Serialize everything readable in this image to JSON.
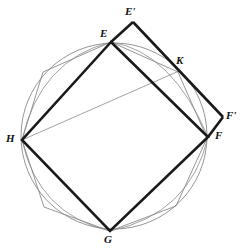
{
  "figure": {
    "canvas": {
      "width": 242,
      "height": 252,
      "background": "#ffffff"
    },
    "colors": {
      "thin_stroke": "#8a8a8a",
      "bold_stroke": "#1a1a1a",
      "label_text": "#111111",
      "background": "#ffffff"
    },
    "stroke_widths": {
      "thin": 0.8,
      "bold": 2.6
    }
  },
  "circle": {
    "name": "circumscribed-circle",
    "cx": 114,
    "cy": 136,
    "r": 93,
    "stroke": "#8a8a8a",
    "stroke_width": 0.9,
    "fill": "none"
  },
  "points": {
    "E": {
      "label": "E",
      "x": 111,
      "y": 42,
      "label_x": 100,
      "label_y": 28
    },
    "F": {
      "label": "F",
      "x": 208,
      "y": 137,
      "label_x": 215,
      "label_y": 130
    },
    "G": {
      "label": "G",
      "x": 110,
      "y": 231,
      "label_x": 104,
      "label_y": 234
    },
    "H": {
      "label": "H",
      "x": 22,
      "y": 140,
      "label_x": 6,
      "label_y": 133
    },
    "Ep": {
      "label": "E'",
      "x": 133,
      "y": 22,
      "label_x": 125,
      "label_y": 6
    },
    "Fp": {
      "label": "F'",
      "x": 223,
      "y": 117,
      "label_x": 226,
      "label_y": 110
    },
    "K": {
      "label": "K",
      "x": 179,
      "y": 71,
      "label_x": 176,
      "label_y": 55
    }
  },
  "octagon": {
    "name": "inscribed-octagon",
    "stroke": "#8a8a8a",
    "stroke_width": 0.9,
    "fill": "none",
    "vertices": [
      {
        "x": 111,
        "y": 42
      },
      {
        "x": 178,
        "y": 72
      },
      {
        "x": 207,
        "y": 138
      },
      {
        "x": 176,
        "y": 206
      },
      {
        "x": 110,
        "y": 231
      },
      {
        "x": 44,
        "y": 207
      },
      {
        "x": 22,
        "y": 140
      },
      {
        "x": 43,
        "y": 72
      }
    ]
  },
  "square": {
    "name": "bold-square-EFGH",
    "stroke": "#1a1a1a",
    "stroke_width": 2.6,
    "fill": "none",
    "vertices": [
      {
        "x": 111,
        "y": 42
      },
      {
        "x": 208,
        "y": 137
      },
      {
        "x": 110,
        "y": 231
      },
      {
        "x": 22,
        "y": 140
      }
    ]
  },
  "bold_paths": [
    {
      "name": "segment-E-to-Eprime",
      "d": "M 111 42 L 133 22"
    },
    {
      "name": "segment-Eprime-to-K-to-Fprime",
      "d": "M 133 22 L 223 117"
    },
    {
      "name": "segment-Fprime-to-F",
      "d": "M 223 117 L 208 137"
    },
    {
      "name": "segment-E-to-K-diagonal",
      "d": "M 111 42 L 208 137"
    }
  ],
  "thin_chords": [
    {
      "name": "chord-E-to-F",
      "x1": 111,
      "y1": 42,
      "x2": 208,
      "y2": 138
    },
    {
      "name": "chord-H-to-E",
      "x1": 22,
      "y1": 140,
      "x2": 111,
      "y2": 42
    },
    {
      "name": "chord-H-to-K",
      "x1": 22,
      "y1": 140,
      "x2": 179,
      "y2": 71
    },
    {
      "name": "chord-H-to-G",
      "x1": 22,
      "y1": 140,
      "x2": 110,
      "y2": 231
    },
    {
      "name": "chord-E-to-Fprime-through-K",
      "x1": 111,
      "y1": 42,
      "x2": 208,
      "y2": 137
    }
  ],
  "thin_arcs": [
    {
      "name": "arc-upper-E-to-F",
      "d": "M 111 42 Q 172 52 208 137"
    },
    {
      "name": "arc-upper-H-to-E",
      "d": "M 22 140 Q 40 60 111 42"
    },
    {
      "name": "arc-lower-H-to-G",
      "d": "M 22 140 Q 38 214 110 231"
    },
    {
      "name": "arc-lower-G-to-F",
      "d": "M 110 231 Q 190 214 208 137"
    }
  ],
  "labels": [
    {
      "key": "Ep",
      "name": "point-label-E-prime"
    },
    {
      "key": "E",
      "name": "point-label-E"
    },
    {
      "key": "K",
      "name": "point-label-K"
    },
    {
      "key": "Fp",
      "name": "point-label-F-prime"
    },
    {
      "key": "F",
      "name": "point-label-F"
    },
    {
      "key": "H",
      "name": "point-label-H"
    },
    {
      "key": "G",
      "name": "point-label-G"
    }
  ]
}
